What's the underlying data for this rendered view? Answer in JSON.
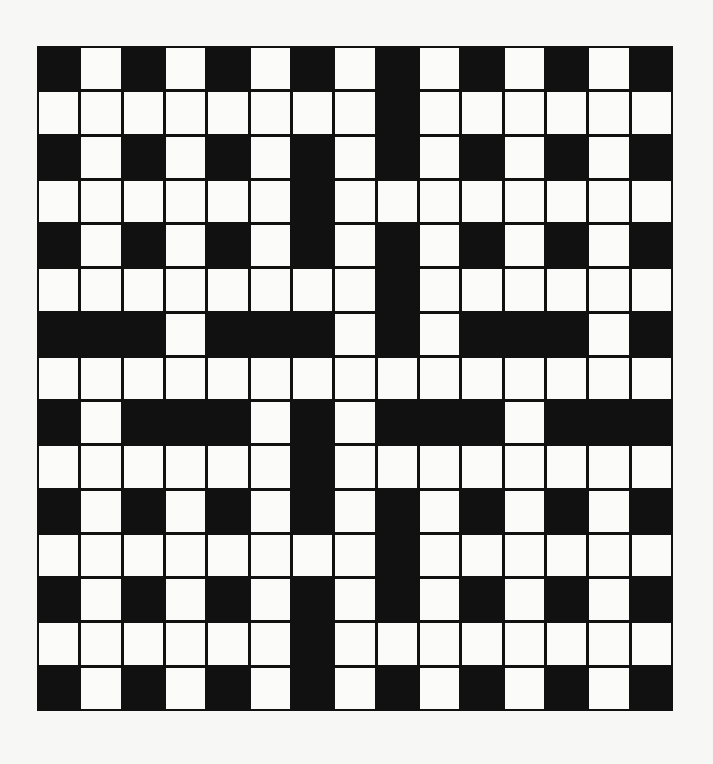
{
  "puzzle": {
    "type": "crossword",
    "rows": 15,
    "cols": 15,
    "colors": {
      "black": "#111111",
      "white": "#fbfbf9",
      "background": "#f7f7f5"
    },
    "grid": [
      "BWBWBWBWBWBWBWB",
      "WWWWWWWWBWWWWWW",
      "BWBWBWBWBWBWBWB",
      "WWWWWWBWWWWWWWW",
      "BWBWBWBWBWBWBWB",
      "WWWWWWWWBWWWWWW",
      "BBBWBBBWBWBBBWB",
      "WWWWWWWWWWWWWWW",
      "BWBBBWBWBBBWBBB",
      "WWWWWWBWWWWWWWW",
      "BWBWBWBWBWBWBWB",
      "WWWWWWWWBWWWWWW",
      "BWBWBWBWBWBWBWB",
      "WWWWWWBWWWWWWWW",
      "BWBWBWBWBWBWBWB"
    ]
  }
}
